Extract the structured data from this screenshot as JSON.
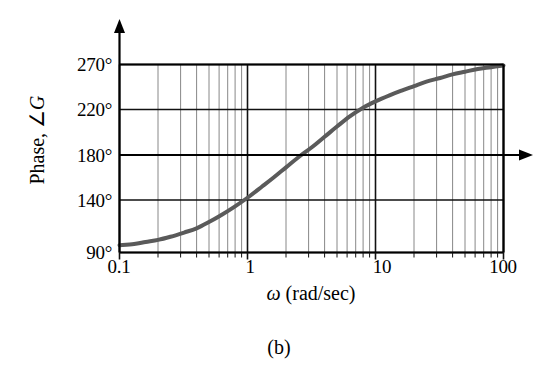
{
  "figure": {
    "caption": "(b)",
    "y_axis_title_prefix": "Phase, ",
    "y_axis_title_angle": "∠",
    "y_axis_title_var": "G",
    "x_axis_title_var": "ω",
    "x_axis_title_units": " (rad/sec)"
  },
  "chart_data": {
    "type": "line",
    "title": "",
    "subtitle": "",
    "xlabel": "ω (rad/sec)",
    "ylabel": "Phase, ∠G",
    "xscale": "log",
    "yscale": "linear",
    "xlim": [
      0.1,
      100
    ],
    "ylim": [
      90,
      270
    ],
    "grid": true,
    "grid_minor": true,
    "legend": "none",
    "xticks": [
      0.1,
      1,
      10,
      100
    ],
    "xtick_labels": [
      "0.1",
      "1",
      "10",
      "100"
    ],
    "yticks": [
      90,
      140,
      180,
      220,
      270
    ],
    "ytick_labels": [
      "90°",
      "140°",
      "180°",
      "220°",
      "270°"
    ],
    "series": [
      {
        "name": "Phase",
        "color": "#5a5a5a",
        "linewidth": 4,
        "x": [
          0.1,
          0.13,
          0.16,
          0.2,
          0.25,
          0.32,
          0.4,
          0.5,
          0.63,
          0.8,
          1.0,
          1.3,
          1.6,
          2.0,
          2.5,
          3.2,
          4.0,
          5.0,
          6.3,
          8.0,
          10.0,
          13.0,
          16.0,
          20.0,
          25.0,
          32.0,
          40.0,
          50.0,
          63.0,
          80.0,
          100.0
        ],
        "y": [
          97,
          98,
          100,
          102,
          105,
          109,
          113,
          119,
          126,
          134,
          142,
          152,
          160,
          169,
          178,
          187,
          196,
          205,
          214,
          222,
          229,
          236,
          241,
          246,
          251,
          255,
          259,
          262,
          265,
          267,
          269
        ]
      }
    ],
    "annotations": [
      {
        "name": "180-degree-reference-arrow",
        "type": "horizontal-arrow",
        "y": 180,
        "from_x": 0.1,
        "to_x": 100,
        "extends_beyond_axis": true
      }
    ]
  },
  "axes": {
    "y_arrow_top": true,
    "x_arrow_right": true
  }
}
